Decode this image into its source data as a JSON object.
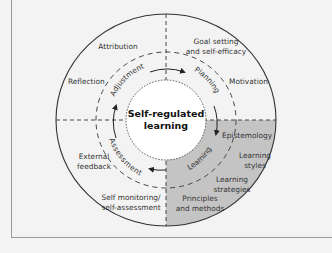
{
  "diagram": {
    "center": {
      "line1": "Self-regulated",
      "line2": "learning"
    },
    "cycle_stages": [
      "Planning",
      "Learning",
      "Assessment",
      "Adjustment"
    ],
    "outer_labels": {
      "top_right": [
        "Goal setting",
        "and self-efficacy"
      ],
      "right_upper": [
        "Motivation"
      ],
      "top_left": [
        "Attribution"
      ],
      "left_upper": [
        "Reflection"
      ],
      "left_lower": [
        "External",
        "feedback"
      ],
      "bottom_left": [
        "Self monitoring/",
        "self-assessment"
      ],
      "bottom_right": [
        "Principles",
        "and methods"
      ],
      "right_1": [
        "Epistemology"
      ],
      "right_2": [
        "Learning",
        "styles"
      ],
      "right_3": [
        "Learning",
        "strategies"
      ]
    },
    "colors": {
      "background": "#f3f3f3",
      "highlight_quadrant": "#c4c4c4",
      "center_fill": "#ffffff",
      "lines": "#333333"
    }
  }
}
